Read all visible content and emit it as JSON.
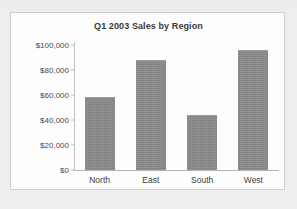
{
  "chart_data": {
    "type": "bar",
    "title": "Q1 2003 Sales by Region",
    "xlabel": "",
    "ylabel": "",
    "categories": [
      "North",
      "East",
      "South",
      "West"
    ],
    "values": [
      58500,
      88000,
      43500,
      96000
    ],
    "ylim": [
      0,
      100000
    ],
    "ytick_values": [
      0,
      20000,
      40000,
      60000,
      80000,
      100000
    ],
    "ytick_labels": [
      "$0",
      "$20,000",
      "$40,000",
      "$60,000",
      "$80,000",
      "$100,000"
    ],
    "grid": false,
    "legend": null,
    "bar_color": "#8a8a8a",
    "plot_background": "#fdfdfd",
    "page_background": "#eeeeee",
    "title_color": "#3a3a3a",
    "axis_color": "#b4b4b4"
  }
}
